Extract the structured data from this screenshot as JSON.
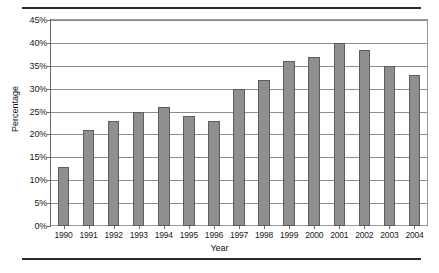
{
  "chart_data": {
    "type": "bar",
    "title": "",
    "xlabel": "Year",
    "ylabel": "Percentage",
    "categories": [
      "1990",
      "1991",
      "1992",
      "1993",
      "1994",
      "1995",
      "1996",
      "1997",
      "1998",
      "1999",
      "2000",
      "2001",
      "2002",
      "2003",
      "2004"
    ],
    "values": [
      13,
      21,
      23,
      25,
      26,
      24,
      23,
      30,
      32,
      36,
      37,
      40,
      38.5,
      35,
      33
    ],
    "ylim": [
      0,
      45
    ],
    "ytick_labels": [
      "0%",
      "5%",
      "10%",
      "15%",
      "20%",
      "25%",
      "30%",
      "35%",
      "40%",
      "45%"
    ],
    "ytick_values": [
      0,
      5,
      10,
      15,
      20,
      25,
      30,
      35,
      40,
      45
    ],
    "grid": true,
    "legend": false,
    "bar_color": "#8f8f8f",
    "bar_border_color": "#5d5d5d",
    "gridline_color": "#8d8d8d",
    "axis_color": "#6a6a6a",
    "background_color": "#ffffff"
  },
  "figure": {
    "top_rule": "",
    "bottom_rule": ""
  }
}
